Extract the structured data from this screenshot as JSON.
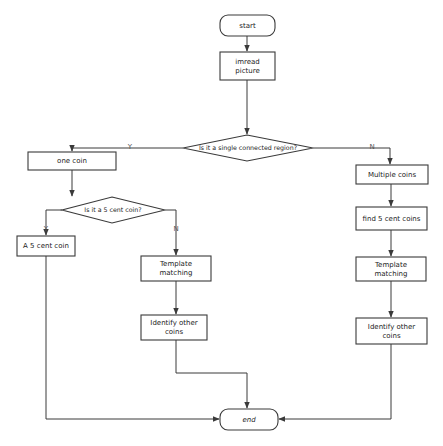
{
  "diagram": {
    "type": "flowchart",
    "nodes": [
      {
        "id": "start",
        "shape": "terminal",
        "lines": [
          "start"
        ]
      },
      {
        "id": "imread",
        "shape": "process",
        "lines": [
          "imread",
          "picture"
        ]
      },
      {
        "id": "single_region",
        "shape": "decision",
        "lines": [
          "Is it a single connected region?"
        ]
      },
      {
        "id": "one_coin",
        "shape": "process",
        "lines": [
          "one coin"
        ]
      },
      {
        "id": "multiple_coins",
        "shape": "process",
        "lines": [
          "Multiple coins"
        ]
      },
      {
        "id": "is_5cent",
        "shape": "decision",
        "lines": [
          "Is it a 5 cent coin?"
        ]
      },
      {
        "id": "a_5cent",
        "shape": "process",
        "lines": [
          "A 5 cent coin"
        ]
      },
      {
        "id": "template_left",
        "shape": "process",
        "lines": [
          "Template",
          "matching"
        ]
      },
      {
        "id": "identify_left",
        "shape": "process",
        "lines": [
          "Identify other",
          "coins"
        ]
      },
      {
        "id": "find_5cent",
        "shape": "process",
        "lines": [
          "find 5 cent coins"
        ]
      },
      {
        "id": "template_right",
        "shape": "process",
        "lines": [
          "Template",
          "matching"
        ]
      },
      {
        "id": "identify_right",
        "shape": "process",
        "lines": [
          "Identify other",
          "coins"
        ]
      },
      {
        "id": "end",
        "shape": "terminal",
        "lines": [
          "end"
        ]
      }
    ],
    "edges": [
      {
        "from": "start",
        "to": "imread",
        "label": ""
      },
      {
        "from": "imread",
        "to": "single_region",
        "label": ""
      },
      {
        "from": "single_region",
        "to": "one_coin",
        "label": "Y"
      },
      {
        "from": "single_region",
        "to": "multiple_coins",
        "label": "N"
      },
      {
        "from": "one_coin",
        "to": "is_5cent",
        "label": ""
      },
      {
        "from": "is_5cent",
        "to": "a_5cent",
        "label": "Y"
      },
      {
        "from": "is_5cent",
        "to": "template_left",
        "label": "N"
      },
      {
        "from": "template_left",
        "to": "identify_left",
        "label": ""
      },
      {
        "from": "multiple_coins",
        "to": "find_5cent",
        "label": ""
      },
      {
        "from": "find_5cent",
        "to": "template_right",
        "label": ""
      },
      {
        "from": "template_right",
        "to": "identify_right",
        "label": ""
      },
      {
        "from": "a_5cent",
        "to": "end",
        "label": ""
      },
      {
        "from": "identify_left",
        "to": "end",
        "label": ""
      },
      {
        "from": "identify_right",
        "to": "end",
        "label": ""
      }
    ]
  },
  "labels": {
    "start": "start",
    "imread_1": "imread",
    "imread_2": "picture",
    "single_region": "Is it a single connected region?",
    "yes_1": "Y",
    "no_1": "N",
    "one_coin": "one coin",
    "multiple_coins": "Multiple coins",
    "is_5cent": "Is it a 5 cent coin?",
    "yes_2": "Y",
    "no_2": "N",
    "a_5cent": "A 5 cent coin",
    "template_left_1": "Template",
    "template_left_2": "matching",
    "identify_left_1": "Identify other",
    "identify_left_2": "coins",
    "find_5cent": "find 5 cent coins",
    "template_right_1": "Template",
    "template_right_2": "matching",
    "identify_right_1": "Identify other",
    "identify_right_2": "coins",
    "end": "end"
  }
}
